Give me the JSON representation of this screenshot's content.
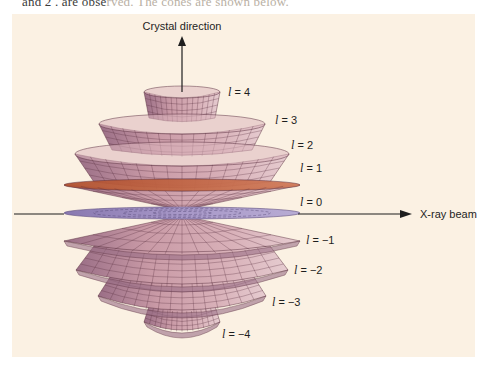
{
  "caption": {
    "text_visible": "and 2 . are observed. The cones are shown below.",
    "text_dark": "and 2 . are obse",
    "text_faded": "rved. The cones are shown below."
  },
  "colors": {
    "page_background": "#ffffff",
    "panel_background": "#fbf1e3",
    "cone_fill": "#c99aa6",
    "cone_fill_light": "#dcb6bd",
    "cone_fill_dark": "#9a6e86",
    "cone_grid": "#5a3040",
    "l1_rim": "#c0603f",
    "l0_disk": "#9c8cc0",
    "axis": "#1e1e1e"
  },
  "axes": {
    "vertical_label": "Crystal direction",
    "horizontal_label": "X-ray beam"
  },
  "cones": [
    {
      "l": 4,
      "label": "l = 4",
      "num": "4",
      "rimY": 92,
      "rx": 38,
      "ry": 6,
      "baseY": 118,
      "baseRx": 33,
      "labelX": 228,
      "labelY": 96
    },
    {
      "l": 3,
      "label": "l = 3",
      "num": "3",
      "rimY": 124,
      "rx": 83,
      "ry": 10,
      "baseY": 150,
      "baseRx": 70,
      "labelX": 275,
      "labelY": 124
    },
    {
      "l": 2,
      "label": "l = 2",
      "num": "2",
      "rimY": 154,
      "rx": 107,
      "ry": 12,
      "baseY": 182,
      "baseRx": 88,
      "labelX": 291,
      "labelY": 149
    },
    {
      "l": 1,
      "label": "l = 1",
      "num": "1",
      "rimY": 185,
      "rx": 118,
      "ry": 6,
      "baseY": 210,
      "baseRx": 2,
      "labelX": 300,
      "labelY": 172
    },
    {
      "l": 0,
      "label": "l = 0",
      "num": "0",
      "rimY": 213,
      "rx": 118,
      "ry": 6,
      "baseY": 213,
      "baseRx": 0,
      "labelX": 300,
      "labelY": 206
    },
    {
      "l": -1,
      "label": "l = −1",
      "num": "−1",
      "rimY": 241,
      "rx": 118,
      "ry": 11,
      "baseY": 216,
      "baseRx": 2,
      "labelX": 306,
      "labelY": 244
    },
    {
      "l": -2,
      "label": "l = −2",
      "num": "−2",
      "rimY": 270,
      "rx": 106,
      "ry": 14,
      "baseY": 246,
      "baseRx": 88,
      "labelX": 294,
      "labelY": 274
    },
    {
      "l": -3,
      "label": "l = −3",
      "num": "−3",
      "rimY": 296,
      "rx": 84,
      "ry": 14,
      "baseY": 274,
      "baseRx": 70,
      "labelX": 272,
      "labelY": 306
    },
    {
      "l": -4,
      "label": "l = −4",
      "num": "−4",
      "rimY": 322,
      "rx": 38,
      "ry": 8,
      "baseY": 306,
      "baseRx": 33,
      "labelX": 222,
      "labelY": 338
    }
  ],
  "geometry": {
    "centerX": 182,
    "axisY": 213,
    "verticalTop": 36,
    "horizontalLeft": 14,
    "horizontalRight": 412
  }
}
